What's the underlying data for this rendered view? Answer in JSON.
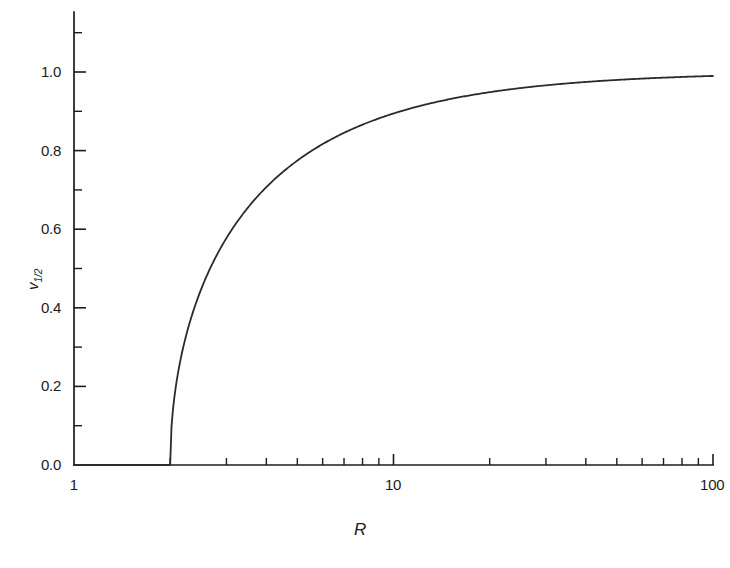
{
  "figure": {
    "background_color": "#fefefe",
    "line_color": "#2b2b2b",
    "axis_color": "#1c1c1c"
  },
  "axes": {
    "x_title": "R",
    "y_title_base": "v",
    "y_title_sub": "1/2"
  },
  "x_ticks": [
    {
      "label": "1",
      "value": 1
    },
    {
      "label": "10",
      "value": 10
    },
    {
      "label": "100",
      "value": 100
    }
  ],
  "y_ticks": [
    {
      "label": "0.0",
      "value": 0.0
    },
    {
      "label": "0.2",
      "value": 0.2
    },
    {
      "label": "0.4",
      "value": 0.4
    },
    {
      "label": "0.6",
      "value": 0.6
    },
    {
      "label": "0.8",
      "value": 0.8
    },
    {
      "label": "1.0",
      "value": 1.0
    }
  ],
  "chart_data": {
    "type": "line",
    "title": "",
    "xlabel": "R",
    "ylabel": "v_1/2",
    "xscale": "log",
    "yscale": "linear",
    "xlim": [
      1,
      100
    ],
    "ylim": [
      0,
      1.1
    ],
    "grid": false,
    "legend": null,
    "x_major_ticks": [
      1,
      10,
      100
    ],
    "x_minor_ticks": [
      2,
      3,
      4,
      5,
      6,
      7,
      8,
      9,
      20,
      30,
      40,
      50,
      60,
      70,
      80,
      90
    ],
    "y_major_ticks": [
      0.0,
      0.2,
      0.4,
      0.6,
      0.8,
      1.0
    ],
    "y_minor_ticks": [
      0.1,
      0.3,
      0.5,
      0.7,
      0.9,
      1.1
    ],
    "threshold_R": 2,
    "series": [
      {
        "name": "v_1/2",
        "x": [
          1.0,
          1.25,
          1.5,
          1.75,
          2.0,
          2.1,
          2.2,
          2.3,
          2.4,
          2.5,
          2.6,
          2.8,
          3.0,
          3.25,
          3.5,
          3.75,
          4.0,
          4.5,
          5.0,
          5.5,
          6.0,
          6.5,
          7.0,
          8.0,
          9.0,
          10.0,
          12.0,
          14.0,
          16.0,
          20.0,
          25.0,
          30.0,
          40.0,
          50.0,
          60.0,
          80.0,
          100.0
        ],
        "y": [
          0.0,
          0.0,
          0.0,
          0.0,
          0.0,
          0.218,
          0.302,
          0.361,
          0.408,
          0.447,
          0.48,
          0.535,
          0.577,
          0.624,
          0.655,
          0.683,
          0.707,
          0.745,
          0.775,
          0.798,
          0.816,
          0.832,
          0.845,
          0.866,
          0.882,
          0.894,
          0.913,
          0.926,
          0.935,
          0.949,
          0.959,
          0.966,
          0.975,
          0.98,
          0.983,
          0.987,
          0.99
        ]
      }
    ]
  }
}
